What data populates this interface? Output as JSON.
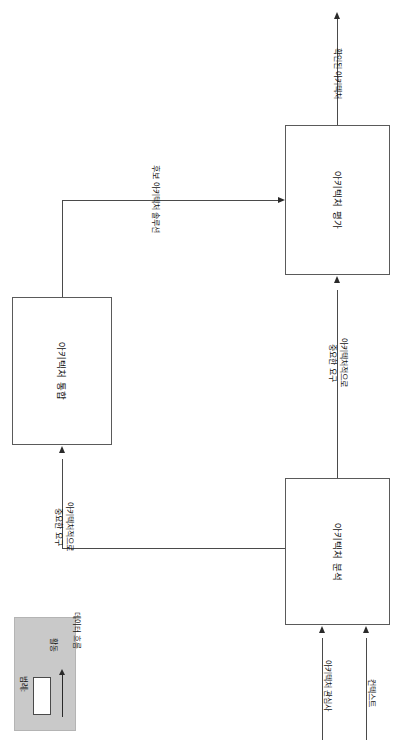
{
  "diagram": {
    "orientation": "rotated-90",
    "activities": [
      {
        "id": "architecture-evaluation",
        "label": "아키텍처 평가"
      },
      {
        "id": "architecture-integration",
        "label": "아키텍처 통합"
      },
      {
        "id": "architecture-analysis",
        "label": "아키텍처 분석"
      }
    ],
    "flows": [
      {
        "id": "confirmed-architecture",
        "label": "확인된 아키텍처"
      },
      {
        "id": "candidate-architecture-solution",
        "label": "후보 아키텍처 솔루션"
      },
      {
        "id": "asr-to-evaluation",
        "label": "아키텍처적으로\n중요한 요구"
      },
      {
        "id": "asr-to-integration",
        "label": "아키텍처적으로\n중요한 요구"
      },
      {
        "id": "architecture-concerns",
        "label": "아키텍처 관심사"
      },
      {
        "id": "context",
        "label": "컨텍스트"
      }
    ]
  },
  "legend": {
    "title": "범례:",
    "entries": [
      {
        "id": "activity",
        "label": "활동",
        "symbol": "box"
      },
      {
        "id": "data-flow",
        "label": "데이터 흐름",
        "symbol": "arrow"
      }
    ]
  },
  "colors": {
    "box_stroke": "#5a5a5a",
    "line": "#4a4a4a",
    "arrow_fill": "#2a2a2a",
    "legend_bg": "#c9c9c9",
    "text": "#111111",
    "canvas": "#ffffff"
  }
}
